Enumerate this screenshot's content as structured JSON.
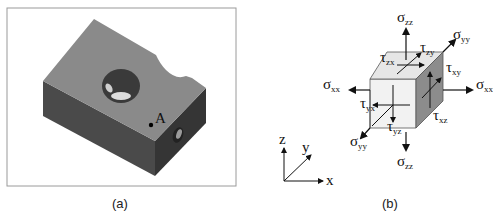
{
  "figure": {
    "panel_a": {
      "caption": "(a)",
      "point_label": "A",
      "colors": {
        "top_face": "#8a8a8a",
        "front_face": "#4a4a4a",
        "side_face": "#3a3a3a",
        "frame": "#9a9a9a"
      }
    },
    "panel_b": {
      "caption": "(b)",
      "axes": {
        "z": "z",
        "y": "y",
        "x": "x"
      },
      "stresses": {
        "sigma_zz_top": {
          "sym": "σ",
          "sub": "zz"
        },
        "sigma_zz_bottom": {
          "sym": "σ",
          "sub": "zz"
        },
        "sigma_yy_back": {
          "sym": "σ",
          "sub": "yy"
        },
        "sigma_yy_front": {
          "sym": "σ",
          "sub": "yy"
        },
        "sigma_xx_left": {
          "sym": "σ",
          "sub": "xx"
        },
        "sigma_xx_right": {
          "sym": "σ",
          "sub": "xx"
        },
        "tau_zx": {
          "sym": "τ",
          "sub": "zx"
        },
        "tau_zy": {
          "sym": "τ",
          "sub": "zy"
        },
        "tau_xy": {
          "sym": "τ",
          "sub": "xy"
        },
        "tau_xz": {
          "sym": "τ",
          "sub": "xz"
        },
        "tau_yx": {
          "sym": "τ",
          "sub": "yx"
        },
        "tau_yz": {
          "sym": "τ",
          "sub": "yz"
        }
      },
      "colors": {
        "front_face": "#f2f2f2",
        "top_face": "#e6e6e6",
        "side_face": "#8c8c8c"
      }
    }
  }
}
